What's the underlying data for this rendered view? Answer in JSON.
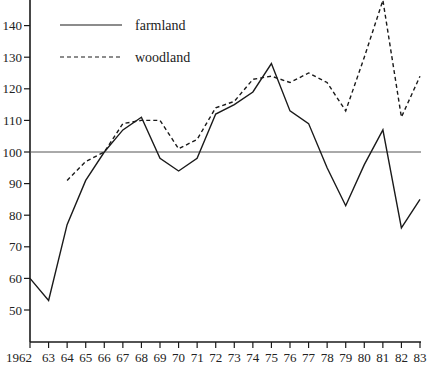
{
  "chart_data": {
    "type": "line",
    "title": "",
    "xlabel": "",
    "ylabel": "",
    "x": [
      "1962",
      "63",
      "64",
      "65",
      "66",
      "67",
      "68",
      "69",
      "70",
      "71",
      "72",
      "73",
      "74",
      "75",
      "76",
      "77",
      "78",
      "79",
      "80",
      "81",
      "82",
      "83"
    ],
    "series": [
      {
        "name": "farmland",
        "style": "solid",
        "values": [
          60,
          53,
          77,
          91,
          100,
          107,
          111,
          98,
          94,
          98,
          112,
          115,
          119,
          128,
          113,
          109,
          95,
          83,
          96,
          107,
          76,
          85
        ]
      },
      {
        "name": "woodland",
        "style": "dashed",
        "values": [
          null,
          null,
          91,
          97,
          100,
          109,
          110,
          110,
          101,
          104,
          114,
          116,
          123,
          124,
          122,
          125,
          122,
          113,
          130,
          148,
          111,
          124
        ]
      }
    ],
    "yticks": [
      50,
      60,
      70,
      80,
      90,
      100,
      110,
      120,
      130,
      140
    ],
    "ylim": [
      40.5,
      148
    ],
    "reference_line": 100,
    "grid": false,
    "legend_position": "top-left",
    "colors": {
      "line": "#1a1a1a",
      "reference": "#555555"
    }
  },
  "legend": {
    "items": [
      {
        "label": "farmland"
      },
      {
        "label": "woodland"
      }
    ]
  }
}
